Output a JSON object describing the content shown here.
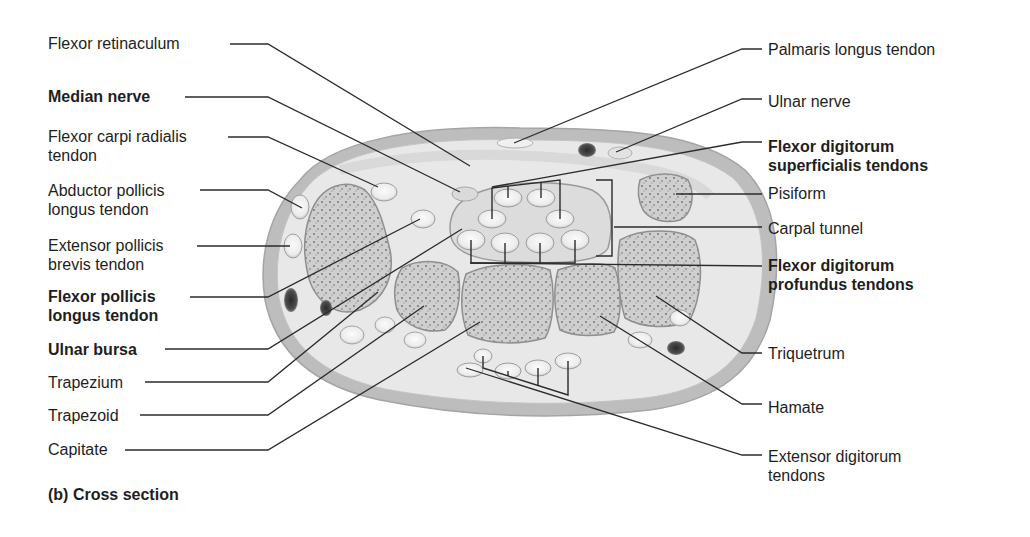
{
  "figure": {
    "caption": "(b) Cross section"
  },
  "labels_left": [
    {
      "id": "flexor-retinaculum",
      "lines": [
        "Flexor retinaculum"
      ],
      "bold": false,
      "x": 48,
      "y": 34,
      "line": [
        [
          230,
          44
        ],
        [
          268,
          44
        ],
        [
          470,
          166
        ]
      ]
    },
    {
      "id": "median-nerve",
      "lines": [
        "Median nerve"
      ],
      "bold": true,
      "x": 48,
      "y": 87,
      "line": [
        [
          185,
          97
        ],
        [
          268,
          97
        ],
        [
          460,
          192
        ]
      ]
    },
    {
      "id": "flexor-carpi-radialis-tendon",
      "lines": [
        "Flexor carpi radialis",
        "tendon"
      ],
      "bold": false,
      "x": 48,
      "y": 127,
      "line": [
        [
          228,
          137
        ],
        [
          268,
          137
        ],
        [
          378,
          187
        ]
      ]
    },
    {
      "id": "abductor-pollicis-longus-tendon",
      "lines": [
        "Abductor pollicis",
        "longus tendon"
      ],
      "bold": false,
      "x": 48,
      "y": 181,
      "line": [
        [
          200,
          190
        ],
        [
          268,
          190
        ],
        [
          302,
          208
        ]
      ]
    },
    {
      "id": "extensor-pollicis-brevis-tendon",
      "lines": [
        "Extensor pollicis",
        "brevis tendon"
      ],
      "bold": false,
      "x": 48,
      "y": 236,
      "line": [
        [
          197,
          246
        ],
        [
          290,
          246
        ]
      ]
    },
    {
      "id": "flexor-pollicis-longus-tendon",
      "lines": [
        "Flexor pollicis",
        "longus tendon"
      ],
      "bold": true,
      "x": 48,
      "y": 287,
      "line": [
        [
          190,
          297
        ],
        [
          268,
          297
        ],
        [
          420,
          219
        ]
      ]
    },
    {
      "id": "ulnar-bursa",
      "lines": [
        "Ulnar bursa"
      ],
      "bold": true,
      "x": 48,
      "y": 340,
      "line": [
        [
          165,
          349
        ],
        [
          268,
          349
        ],
        [
          462,
          229
        ]
      ]
    },
    {
      "id": "trapezium",
      "lines": [
        "Trapezium"
      ],
      "bold": false,
      "x": 48,
      "y": 373,
      "line": [
        [
          145,
          382
        ],
        [
          268,
          382
        ],
        [
          378,
          292
        ]
      ]
    },
    {
      "id": "trapezoid",
      "lines": [
        "Trapezoid"
      ],
      "bold": false,
      "x": 48,
      "y": 406,
      "line": [
        [
          140,
          415
        ],
        [
          268,
          415
        ],
        [
          424,
          306
        ]
      ]
    },
    {
      "id": "capitate",
      "lines": [
        "Capitate"
      ],
      "bold": false,
      "x": 48,
      "y": 440,
      "line": [
        [
          125,
          450
        ],
        [
          268,
          450
        ],
        [
          480,
          322
        ]
      ]
    }
  ],
  "labels_right": [
    {
      "id": "palmaris-longus-tendon",
      "lines": [
        "Palmaris longus tendon"
      ],
      "bold": false,
      "x": 768,
      "y": 40,
      "line": [
        [
          762,
          49
        ],
        [
          742,
          49
        ],
        [
          514,
          143
        ]
      ]
    },
    {
      "id": "ulnar-nerve",
      "lines": [
        "Ulnar nerve"
      ],
      "bold": false,
      "x": 768,
      "y": 92,
      "line": [
        [
          762,
          99
        ],
        [
          742,
          99
        ],
        [
          616,
          152
        ]
      ]
    },
    {
      "id": "flexor-digitorum-superficialis-tendons",
      "lines": [
        "Flexor digitorum",
        "superficialis tendons"
      ],
      "bold": true,
      "x": 768,
      "y": 137,
      "line": [
        [
          762,
          142
        ],
        [
          742,
          142
        ],
        [
          492,
          187
        ]
      ]
    },
    {
      "id": "pisiform",
      "lines": [
        "Pisiform"
      ],
      "bold": false,
      "x": 768,
      "y": 184,
      "line": [
        [
          762,
          194
        ],
        [
          676,
          194
        ]
      ]
    },
    {
      "id": "carpal-tunnel",
      "lines": [
        "Carpal tunnel"
      ],
      "bold": false,
      "x": 768,
      "y": 219,
      "line": [
        [
          762,
          227
        ],
        [
          614,
          227
        ]
      ]
    },
    {
      "id": "flexor-digitorum-profundus-tendons",
      "lines": [
        "Flexor digitorum",
        "profundus tendons"
      ],
      "bold": true,
      "x": 768,
      "y": 256,
      "line": [
        [
          762,
          266
        ],
        [
          470,
          263
        ]
      ]
    },
    {
      "id": "triquetrum",
      "lines": [
        "Triquetrum"
      ],
      "bold": false,
      "x": 768,
      "y": 344,
      "line": [
        [
          762,
          353
        ],
        [
          742,
          353
        ],
        [
          656,
          296
        ]
      ]
    },
    {
      "id": "hamate",
      "lines": [
        "Hamate"
      ],
      "bold": false,
      "x": 768,
      "y": 398,
      "line": [
        [
          762,
          404
        ],
        [
          742,
          404
        ],
        [
          600,
          316
        ]
      ]
    },
    {
      "id": "extensor-digitorum-tendons",
      "lines": [
        "Extensor digitorum",
        "tendons"
      ],
      "bold": false,
      "x": 768,
      "y": 447,
      "line": [
        [
          762,
          455
        ],
        [
          742,
          455
        ],
        [
          466,
          368
        ]
      ]
    }
  ],
  "colors": {
    "skin_outer": "#bdbdbd",
    "tissue": "#e6e6e6",
    "bone": "#d2d2d2",
    "bone_speckle": "#8a8a8a",
    "tendon": "#f4f4f4",
    "tendon_ring": "#a9a9a9",
    "vessel": "#4a4a4a",
    "leader": "#2b2b2b"
  }
}
